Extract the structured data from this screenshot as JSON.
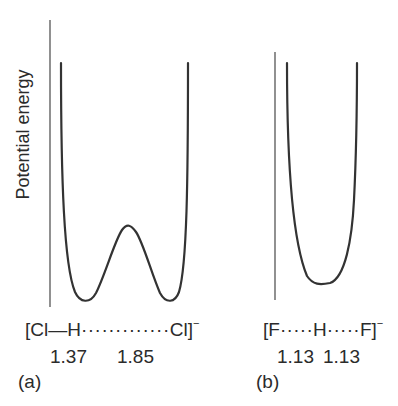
{
  "y_axis_label": "Potential energy",
  "panels": [
    {
      "id": "a",
      "panel_label": "(a)",
      "species": {
        "open": "[",
        "left_atom": "Cl",
        "bond1": "—",
        "middle_atom": "H",
        "bond2": "·············",
        "right_atom": "Cl",
        "close": "]",
        "charge": "−"
      },
      "distances": [
        "1.37",
        "1.85"
      ],
      "curve_type": "double-well (asymmetric hydrogen bond)"
    },
    {
      "id": "b",
      "panel_label": "(b)",
      "species": {
        "open": "[",
        "left_atom": "F",
        "bond1": "·····",
        "middle_atom": "H",
        "bond2": "·····",
        "right_atom": "F",
        "close": "]",
        "charge": "−"
      },
      "distances": [
        "1.13",
        "1.13"
      ],
      "curve_type": "single-well (symmetric hydrogen bond)"
    }
  ],
  "colors": {
    "line": "#333333",
    "axis": "#555555",
    "text": "#2b2b2b"
  }
}
